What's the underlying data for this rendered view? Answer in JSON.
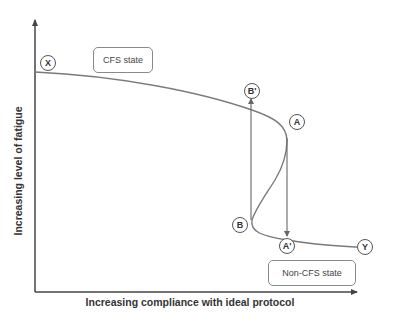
{
  "axes": {
    "y_label": "Increasing level of fatigue",
    "x_label": "Increasing compliance with ideal protocol"
  },
  "regions": {
    "top": "CFS state",
    "bottom": "Non-CFS state"
  },
  "points": {
    "X": "X",
    "B_prime": "B'",
    "A": "A",
    "B": "B",
    "A_prime": "A'",
    "Y": "Y"
  },
  "colors": {
    "curve": "#7a7a7a",
    "axis": "#444444"
  }
}
